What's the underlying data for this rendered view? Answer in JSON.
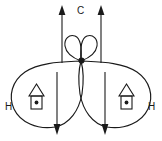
{
  "diagram": {
    "background_color": "#ffffff",
    "stroke_color": "#1a1a1a",
    "labels": {
      "carbon": "C",
      "hydrogen_left": "H",
      "hydrogen_right": "H"
    },
    "orbitals": {
      "p_orbital_top": {
        "name": "p-orbital",
        "lobe_count": 2,
        "position": "top-center"
      },
      "sp2_lobe_left": {
        "name": "sp2-hybrid-orbital-left",
        "position": "lower-left"
      },
      "sp2_lobe_right": {
        "name": "sp2-hybrid-orbital-right",
        "position": "lower-right"
      }
    },
    "arrows": {
      "up_left": {
        "direction": "up",
        "x": 62
      },
      "up_right": {
        "direction": "up",
        "x": 101
      },
      "down_left": {
        "direction": "down",
        "x": 57
      },
      "down_right": {
        "direction": "down",
        "x": 105
      }
    },
    "electron_boxes": {
      "left": {
        "name": "electron-box-left",
        "dot_count": 1
      },
      "right": {
        "name": "electron-box-right",
        "dot_count": 1
      }
    }
  }
}
